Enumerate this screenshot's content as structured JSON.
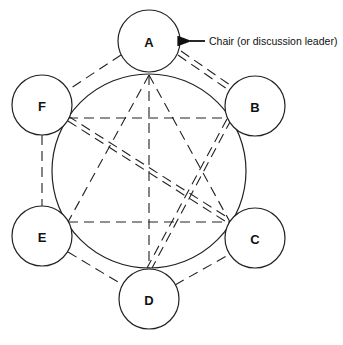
{
  "diagram": {
    "title": "",
    "nodes": [
      {
        "id": "A",
        "label": "A",
        "cx": 149,
        "cy": 41,
        "r": 31,
        "contact": [
          149,
          75
        ]
      },
      {
        "id": "B",
        "label": "B",
        "cx": 255,
        "cy": 106,
        "r": 30,
        "contact": [
          229,
          118
        ]
      },
      {
        "id": "C",
        "label": "C",
        "cx": 255,
        "cy": 238,
        "r": 30,
        "contact": [
          230,
          222
        ]
      },
      {
        "id": "D",
        "label": "D",
        "cx": 149,
        "cy": 299,
        "r": 30,
        "contact": [
          149,
          268
        ]
      },
      {
        "id": "E",
        "label": "E",
        "cx": 42,
        "cy": 236,
        "r": 30,
        "contact": [
          68,
          222
        ]
      },
      {
        "id": "F",
        "label": "F",
        "cx": 42,
        "cy": 105,
        "r": 30,
        "contact": [
          68,
          118
        ]
      }
    ],
    "table_circle": {
      "cx": 149,
      "cy": 171,
      "r": 97
    },
    "annotation": {
      "text": "Chair (or discussion leader)",
      "points_to": "A"
    },
    "connections": [
      {
        "from": "A",
        "to": "B",
        "style": "double-dashed",
        "path": "outer"
      },
      {
        "from": "A",
        "to": "F",
        "style": "dashed",
        "path": "outer"
      },
      {
        "from": "F",
        "to": "E",
        "style": "dashed",
        "path": "outer"
      },
      {
        "from": "E",
        "to": "D",
        "style": "dashed",
        "path": "outer"
      },
      {
        "from": "D",
        "to": "C",
        "style": "dashed",
        "path": "outer"
      },
      {
        "from": "A",
        "to": "D",
        "style": "dashed",
        "path": "inner"
      },
      {
        "from": "A",
        "to": "E",
        "style": "dashed",
        "path": "inner"
      },
      {
        "from": "A",
        "to": "C",
        "style": "dashed",
        "path": "inner"
      },
      {
        "from": "F",
        "to": "B",
        "style": "dashed",
        "path": "inner"
      },
      {
        "from": "E",
        "to": "C",
        "style": "dashed",
        "path": "inner"
      },
      {
        "from": "F",
        "to": "C",
        "style": "double-dashed",
        "path": "inner"
      },
      {
        "from": "B",
        "to": "D",
        "style": "double-dashed",
        "path": "inner"
      }
    ]
  }
}
